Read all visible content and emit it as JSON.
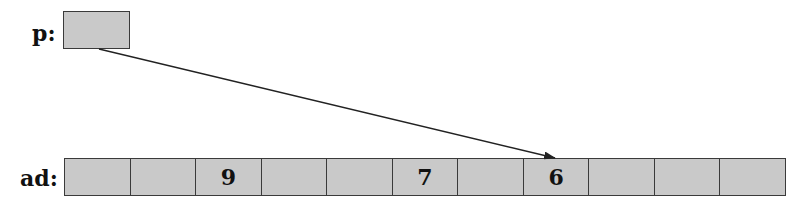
{
  "pointer": {
    "label": "p:",
    "value": ""
  },
  "array": {
    "label": "ad:",
    "cells": [
      "",
      "",
      "9",
      "",
      "",
      "7",
      "",
      "6",
      "",
      "",
      ""
    ],
    "pointed_index": 7
  },
  "colors": {
    "cell_fill": "#c9c9c9",
    "border": "#3a3a3a",
    "arrow": "#222222"
  }
}
